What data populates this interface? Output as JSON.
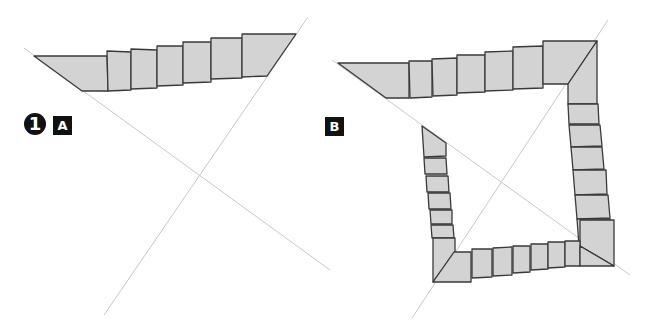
{
  "panels": [
    {
      "id": "A",
      "step_number": "1",
      "label": "A",
      "guide_lines": [
        [
          24,
          48,
          330,
          270
        ],
        [
          308,
          17,
          104,
          315
        ]
      ],
      "pieces": [
        [
          [
            34,
            56
          ],
          [
            107,
            56
          ],
          [
            108,
            91
          ],
          [
            82,
            91
          ]
        ],
        [
          [
            107,
            51
          ],
          [
            131,
            52
          ],
          [
            131,
            90
          ],
          [
            108,
            91
          ]
        ],
        [
          [
            131,
            49
          ],
          [
            157,
            50
          ],
          [
            157,
            88
          ],
          [
            131,
            89
          ]
        ],
        [
          [
            157,
            46
          ],
          [
            183,
            46
          ],
          [
            183,
            85
          ],
          [
            157,
            86
          ]
        ],
        [
          [
            183,
            42
          ],
          [
            211,
            42
          ],
          [
            211,
            82
          ],
          [
            183,
            83
          ]
        ],
        [
          [
            211,
            38
          ],
          [
            242,
            38
          ],
          [
            242,
            78
          ],
          [
            211,
            79
          ]
        ],
        [
          [
            242,
            34
          ],
          [
            296,
            34
          ],
          [
            267,
            76
          ],
          [
            242,
            77
          ]
        ]
      ]
    },
    {
      "id": "B",
      "label": "B",
      "guide_lines": [
        [
          332,
          60,
          630,
          275
        ],
        [
          608,
          20,
          412,
          318
        ]
      ],
      "pieces": [
        [
          [
            338,
            63
          ],
          [
            409,
            63
          ],
          [
            409,
            98
          ],
          [
            386,
            98
          ]
        ],
        [
          [
            409,
            61
          ],
          [
            432,
            61
          ],
          [
            432,
            97
          ],
          [
            410,
            98
          ]
        ],
        [
          [
            432,
            59
          ],
          [
            457,
            58
          ],
          [
            457,
            95
          ],
          [
            433,
            96
          ]
        ],
        [
          [
            457,
            55
          ],
          [
            485,
            55
          ],
          [
            485,
            92
          ],
          [
            457,
            93
          ]
        ],
        [
          [
            485,
            52
          ],
          [
            513,
            51
          ],
          [
            513,
            90
          ],
          [
            485,
            91
          ]
        ],
        [
          [
            513,
            47
          ],
          [
            543,
            46
          ],
          [
            543,
            88
          ],
          [
            513,
            89
          ]
        ],
        [
          [
            543,
            41
          ],
          [
            597,
            41
          ],
          [
            568,
            84
          ],
          [
            543,
            84
          ]
        ],
        [
          [
            597,
            41
          ],
          [
            597,
            104
          ],
          [
            568,
            104
          ],
          [
            568,
            84
          ]
        ],
        [
          [
            568,
            104
          ],
          [
            598,
            104
          ],
          [
            599,
            124
          ],
          [
            569,
            124
          ]
        ],
        [
          [
            569,
            125
          ],
          [
            600,
            125
          ],
          [
            602,
            146
          ],
          [
            571,
            147
          ]
        ],
        [
          [
            571,
            147
          ],
          [
            602,
            147
          ],
          [
            604,
            169
          ],
          [
            573,
            170
          ]
        ],
        [
          [
            573,
            170
          ],
          [
            606,
            170
          ],
          [
            607,
            194
          ],
          [
            575,
            195
          ]
        ],
        [
          [
            575,
            195
          ],
          [
            608,
            195
          ],
          [
            610,
            218
          ],
          [
            577,
            219
          ]
        ],
        [
          [
            577,
            219
          ],
          [
            610,
            219
          ],
          [
            611,
            246
          ],
          [
            579,
            246
          ]
        ],
        [
          [
            580,
            220
          ],
          [
            614,
            220
          ],
          [
            614,
            266
          ],
          [
            580,
            246
          ]
        ],
        [
          [
            422,
            126
          ],
          [
            446,
            143
          ],
          [
            446,
            156
          ],
          [
            424,
            157
          ]
        ],
        [
          [
            424,
            158
          ],
          [
            446,
            158
          ],
          [
            447,
            174
          ],
          [
            425,
            174
          ]
        ],
        [
          [
            426,
            176
          ],
          [
            448,
            176
          ],
          [
            449,
            192
          ],
          [
            427,
            192
          ]
        ],
        [
          [
            428,
            193
          ],
          [
            450,
            193
          ],
          [
            451,
            209
          ],
          [
            429,
            209
          ]
        ],
        [
          [
            430,
            210
          ],
          [
            452,
            210
          ],
          [
            452,
            224
          ],
          [
            431,
            224
          ]
        ],
        [
          [
            431,
            225
          ],
          [
            453,
            225
          ],
          [
            454,
            238
          ],
          [
            432,
            238
          ]
        ],
        [
          [
            433,
            238
          ],
          [
            455,
            238
          ],
          [
            455,
            252
          ],
          [
            433,
            282
          ]
        ],
        [
          [
            433,
            282
          ],
          [
            454,
            252
          ],
          [
            471,
            252
          ],
          [
            471,
            282
          ]
        ],
        [
          [
            472,
            249
          ],
          [
            492,
            249
          ],
          [
            492,
            277
          ],
          [
            472,
            278
          ]
        ],
        [
          [
            493,
            248
          ],
          [
            512,
            247
          ],
          [
            512,
            275
          ],
          [
            493,
            276
          ]
        ],
        [
          [
            513,
            246
          ],
          [
            530,
            246
          ],
          [
            530,
            272
          ],
          [
            513,
            273
          ]
        ],
        [
          [
            531,
            244
          ],
          [
            548,
            244
          ],
          [
            548,
            269
          ],
          [
            531,
            270
          ]
        ],
        [
          [
            548,
            242
          ],
          [
            565,
            242
          ],
          [
            565,
            267
          ],
          [
            548,
            268
          ]
        ],
        [
          [
            565,
            241
          ],
          [
            580,
            241
          ],
          [
            580,
            266
          ],
          [
            565,
            266
          ]
        ],
        [
          [
            580,
            246
          ],
          [
            614,
            266
          ],
          [
            580,
            266
          ]
        ]
      ]
    }
  ],
  "colors": {
    "piece_fill": "#d3d3d3",
    "piece_stroke": "#3a3a3a",
    "guide_line": "#c8c8c8",
    "label_bg": "#111111",
    "label_text": "#ffffff"
  }
}
